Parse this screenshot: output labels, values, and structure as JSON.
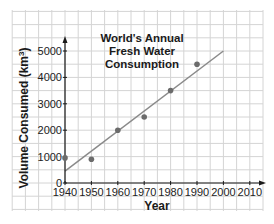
{
  "chart_data": {
    "type": "scatter",
    "title": "World's Annual Fresh Water Consumption",
    "title_lines": [
      "World's Annual",
      "Fresh Water",
      "Consumption"
    ],
    "xlabel": "Year",
    "ylabel": "Volume Consumed (km³)",
    "ylabel_main": "Volume Consumed (km",
    "ylabel_sup": "3",
    "ylabel_end": ")",
    "xlim": [
      1940,
      2013
    ],
    "ylim": [
      0,
      5200
    ],
    "x_ticks": [
      1940,
      1950,
      1960,
      1970,
      1980,
      1990,
      2000,
      2010
    ],
    "x_tick_labels": [
      "1940",
      "1950",
      "1960",
      "1970",
      "1980",
      "1990",
      "2000",
      "2010"
    ],
    "y_ticks": [
      0,
      1000,
      2000,
      3000,
      4000,
      5000
    ],
    "y_tick_labels": [
      "0",
      "1000",
      "2000",
      "3000",
      "4000",
      "5000"
    ],
    "grid": true,
    "legend": null,
    "series": [
      {
        "name": "Observed consumption",
        "type": "scatter",
        "x": [
          1940,
          1950,
          1960,
          1970,
          1980,
          1990
        ],
        "y": [
          950,
          900,
          2000,
          2500,
          3500,
          4500
        ]
      },
      {
        "name": "Line of best fit",
        "type": "line",
        "x": [
          1940,
          2000
        ],
        "y": [
          450,
          5000
        ]
      }
    ],
    "colors": {
      "points": "#6b6b6b",
      "fit_line": "#8a8a8a",
      "axes": "#1a1a1a",
      "grid": "#d4d4d4"
    }
  }
}
